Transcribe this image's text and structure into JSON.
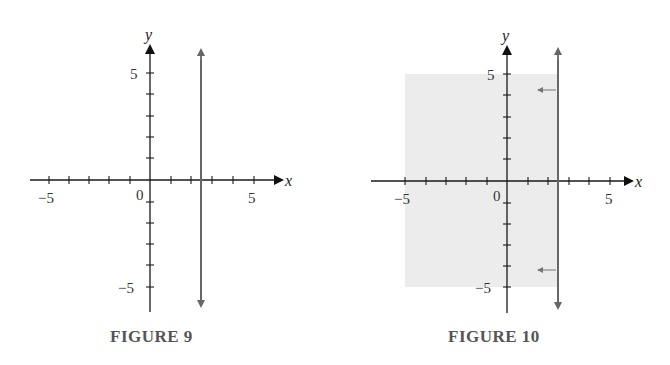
{
  "figures": [
    {
      "caption": "FIGURE 9",
      "x_axis": {
        "label": "x",
        "tick_labels": {
          "neg": "−5",
          "pos": "5",
          "origin": "0"
        }
      },
      "y_axis": {
        "label": "y",
        "tick_labels": {
          "pos": "5",
          "neg": "−5"
        }
      },
      "vertical_line_x": 2.5,
      "shaded": false
    },
    {
      "caption": "FIGURE 10",
      "x_axis": {
        "label": "x",
        "tick_labels": {
          "neg": "−5",
          "pos": "5",
          "origin": "0"
        }
      },
      "y_axis": {
        "label": "y",
        "tick_labels": {
          "pos": "5",
          "neg": "−5"
        }
      },
      "vertical_line_x": 2.5,
      "shaded": true,
      "shaded_region": "x < 2.5",
      "direction_arrows": [
        "left",
        "left"
      ]
    }
  ],
  "colors": {
    "axis": "#1a1a1a",
    "boundary_line": "#666666",
    "shade": "#ececec",
    "caption": "#555555"
  }
}
